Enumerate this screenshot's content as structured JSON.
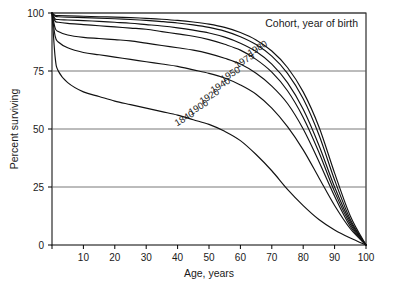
{
  "chart_data": {
    "type": "line",
    "title": "Cohort, year of birth",
    "xlabel": "Age, years",
    "ylabel": "Percent surviving",
    "xlim": [
      0,
      100
    ],
    "ylim": [
      0,
      100
    ],
    "xticks": [
      0,
      10,
      20,
      30,
      40,
      50,
      60,
      70,
      80,
      90,
      100
    ],
    "xticklabels": [
      "",
      "10",
      "20",
      "30",
      "40",
      "50",
      "60",
      "70",
      "80",
      "90",
      "100"
    ],
    "yticks": [
      0,
      25,
      50,
      75,
      100
    ],
    "yticklabels": [
      "0",
      "25",
      "50",
      "75",
      "100"
    ],
    "grid": "horizontal",
    "legend": "inline-curve-labels",
    "x": [
      0,
      1,
      2,
      5,
      10,
      15,
      20,
      25,
      30,
      35,
      40,
      45,
      50,
      55,
      60,
      65,
      70,
      75,
      80,
      85,
      90,
      95,
      100
    ],
    "series": [
      {
        "name": "1840",
        "label": "1840",
        "values": [
          100,
          81,
          75,
          70,
          66,
          64,
          62,
          60.5,
          59,
          57.5,
          56,
          54,
          52,
          49,
          45,
          39,
          32,
          24,
          17,
          11,
          6.5,
          3,
          0
        ]
      },
      {
        "name": "1900",
        "label": "1900",
        "values": [
          100,
          90,
          87.5,
          85,
          83,
          82,
          81,
          80,
          79,
          78,
          77,
          75.5,
          74,
          72,
          69,
          65,
          59,
          51,
          41,
          29,
          17,
          7,
          0
        ]
      },
      {
        "name": "1920",
        "label": "1920",
        "values": [
          100,
          93.5,
          92,
          90.5,
          89.5,
          89,
          88.5,
          88,
          87,
          86,
          85,
          84,
          82.5,
          80.5,
          78,
          74,
          68.5,
          61,
          50,
          36,
          21,
          8,
          0
        ]
      },
      {
        "name": "1940",
        "label": "1940",
        "values": [
          100,
          96.5,
          96,
          95.5,
          95,
          94.5,
          94,
          93.5,
          93,
          92,
          91,
          90,
          88.5,
          86.5,
          84,
          80,
          74.5,
          66.5,
          55,
          40,
          23,
          9,
          0
        ]
      },
      {
        "name": "1950",
        "label": "1950",
        "values": [
          100,
          97.5,
          97.2,
          97,
          96.7,
          96.4,
          96,
          95.6,
          95,
          94.4,
          93.6,
          92.6,
          91.4,
          89.6,
          87,
          83.4,
          78,
          70,
          58.5,
          43,
          25,
          10,
          0
        ]
      },
      {
        "name": "1975",
        "label": "1975",
        "values": [
          100,
          98.6,
          98.4,
          98.2,
          98,
          97.8,
          97.5,
          97.2,
          96.8,
          96.3,
          95.7,
          94.9,
          93.8,
          92.2,
          89.8,
          86.4,
          81.4,
          74,
          63,
          47.5,
          28,
          11,
          0
        ]
      },
      {
        "name": "1980",
        "label": "1980",
        "values": [
          100,
          99,
          98.9,
          98.8,
          98.6,
          98.4,
          98.2,
          98,
          97.7,
          97.3,
          96.8,
          96.1,
          95.2,
          93.8,
          91.6,
          88.4,
          83.6,
          76.5,
          66,
          51,
          31,
          12.5,
          0
        ]
      }
    ],
    "label_positions": [
      {
        "name": "1840",
        "x": 186,
        "y": 121,
        "rotate": -31
      },
      {
        "name": "1900",
        "x": 200,
        "y": 110,
        "rotate": -31
      },
      {
        "name": "1920",
        "x": 211,
        "y": 99,
        "rotate": -31
      },
      {
        "name": "1940",
        "x": 222,
        "y": 88,
        "rotate": -31
      },
      {
        "name": "1950",
        "x": 232,
        "y": 77,
        "rotate": -31
      },
      {
        "name": "1975",
        "x": 246,
        "y": 63,
        "rotate": -31
      },
      {
        "name": "1980",
        "x": 259,
        "y": 51,
        "rotate": -31
      }
    ]
  }
}
